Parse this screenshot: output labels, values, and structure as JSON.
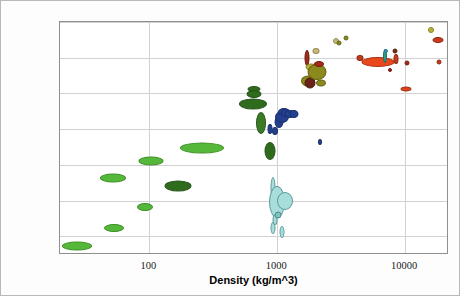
{
  "chart_data": {
    "type": "scatter",
    "title": "",
    "xlabel": "Density (kg/m^3)",
    "ylabel": "Young's modulus (GPa)",
    "xscale": "log",
    "yscale": "log",
    "xlim": [
      20,
      22000
    ],
    "ylim": [
      0.0003,
      1000
    ],
    "grid": true,
    "legend": "none",
    "xticks": [
      "100",
      "1000",
      "10000"
    ],
    "xtick_values": [
      100,
      1000,
      10000
    ],
    "yticks": [
      "1000",
      "100",
      "10",
      "1",
      "0.1",
      "0.01",
      "0.001"
    ],
    "ytick_values": [
      1000,
      100,
      10,
      1,
      0.1,
      0.01,
      0.001
    ],
    "marker_shape": "ellipse",
    "bubbles": [
      {
        "group": "foams-low-density",
        "x": 27,
        "y": 0.00055,
        "w": 30,
        "h": 9,
        "color": "#56b83a",
        "stroke": "#3f8f28"
      },
      {
        "group": "foams-low-density",
        "x": 53,
        "y": 0.0017,
        "w": 20,
        "h": 8,
        "color": "#56b83a",
        "stroke": "#3f8f28"
      },
      {
        "group": "foams-low-density",
        "x": 52,
        "y": 0.042,
        "w": 26,
        "h": 9,
        "color": "#56b83a",
        "stroke": "#3f8f28"
      },
      {
        "group": "foams-low-density",
        "x": 93,
        "y": 0.0065,
        "w": 16,
        "h": 8,
        "color": "#56b83a",
        "stroke": "#3f8f28"
      },
      {
        "group": "foams-low-density",
        "x": 103,
        "y": 0.125,
        "w": 25,
        "h": 9,
        "color": "#56b83a",
        "stroke": "#3f8f28"
      },
      {
        "group": "cork-natural",
        "x": 167,
        "y": 0.026,
        "w": 27,
        "h": 11,
        "color": "#2f6b1d",
        "stroke": "#24521a"
      },
      {
        "group": "foams-low-density",
        "x": 260,
        "y": 0.3,
        "w": 44,
        "h": 11,
        "color": "#56b83a",
        "stroke": "#3f8f28"
      },
      {
        "group": "wood-parallel",
        "x": 660,
        "y": 13.0,
        "w": 13,
        "h": 6,
        "color": "#2f6b1d",
        "stroke": "#24521a"
      },
      {
        "group": "wood-parallel",
        "x": 660,
        "y": 9.5,
        "w": 15,
        "h": 8,
        "color": "#2f6b1d",
        "stroke": "#24521a"
      },
      {
        "group": "wood-parallel",
        "x": 640,
        "y": 5.2,
        "w": 28,
        "h": 11,
        "color": "#2f6b1d",
        "stroke": "#24521a"
      },
      {
        "group": "wood-perpendicular",
        "x": 745,
        "y": 1.5,
        "w": 10,
        "h": 22,
        "color": "#3d7a28",
        "stroke": "#2d5c1e"
      },
      {
        "group": "wood-perpendicular",
        "x": 880,
        "y": 0.25,
        "w": 11,
        "h": 18,
        "color": "#2f6b1d",
        "stroke": "#24521a"
      },
      {
        "group": "wood-perpendicular",
        "x": 880,
        "y": 1.0,
        "w": 5,
        "h": 10,
        "color": "#23408f",
        "stroke": "#1b3070"
      },
      {
        "group": "polymers",
        "x": 960,
        "y": 0.9,
        "w": 6,
        "h": 8,
        "color": "#23408f",
        "stroke": "#1b3070"
      },
      {
        "group": "polymers",
        "x": 1030,
        "y": 1.6,
        "w": 9,
        "h": 12,
        "color": "#23408f",
        "stroke": "#1b3070"
      },
      {
        "group": "polymers",
        "x": 1080,
        "y": 2.2,
        "w": 14,
        "h": 12,
        "color": "#23408f",
        "stroke": "#1b3070"
      },
      {
        "group": "polymers",
        "x": 1130,
        "y": 3.0,
        "w": 12,
        "h": 8,
        "color": "#23408f",
        "stroke": "#1b3070"
      },
      {
        "group": "polymers",
        "x": 1180,
        "y": 2.9,
        "w": 10,
        "h": 8,
        "color": "#23408f",
        "stroke": "#1b3070"
      },
      {
        "group": "polymers",
        "x": 1260,
        "y": 2.7,
        "w": 11,
        "h": 8,
        "color": "#23408f",
        "stroke": "#1b3070"
      },
      {
        "group": "polymers",
        "x": 1340,
        "y": 2.6,
        "w": 9,
        "h": 8,
        "color": "#23408f",
        "stroke": "#1b3070"
      },
      {
        "group": "polymers",
        "x": 2150,
        "y": 0.44,
        "w": 4,
        "h": 6,
        "color": "#23408f",
        "stroke": "#1b3070"
      },
      {
        "group": "elastomers-foams",
        "x": 930,
        "y": 0.023,
        "w": 5,
        "h": 22,
        "color": "#a7ddda",
        "stroke": "#5e9c99"
      },
      {
        "group": "elastomers-foams",
        "x": 1000,
        "y": 0.009,
        "w": 16,
        "h": 32,
        "color": "#a7ddda",
        "stroke": "#5e9c99"
      },
      {
        "group": "elastomers-foams",
        "x": 1150,
        "y": 0.0095,
        "w": 16,
        "h": 18,
        "color": "#a7ddda",
        "stroke": "#5e9c99"
      },
      {
        "group": "elastomers-foams",
        "x": 930,
        "y": 0.0017,
        "w": 5,
        "h": 12,
        "color": "#a7ddda",
        "stroke": "#5e9c99"
      },
      {
        "group": "elastomers-foams",
        "x": 955,
        "y": 0.0028,
        "w": 5,
        "h": 10,
        "color": "#a7ddda",
        "stroke": "#5e9c99"
      },
      {
        "group": "elastomers-foams",
        "x": 1090,
        "y": 0.0013,
        "w": 5,
        "h": 12,
        "color": "#a7ddda",
        "stroke": "#5e9c99"
      },
      {
        "group": "elastomers-foams",
        "x": 1010,
        "y": 0.004,
        "w": 7,
        "h": 7,
        "color": "#7ec4c0",
        "stroke": "#4d8b88"
      },
      {
        "group": "ceramics",
        "x": 1700,
        "y": 100,
        "w": 5,
        "h": 16,
        "color": "#9c2a1a",
        "stroke": "#6e1c10"
      },
      {
        "group": "ceramics",
        "x": 1750,
        "y": 22,
        "w": 14,
        "h": 11,
        "color": "#8c8a1c",
        "stroke": "#646313"
      },
      {
        "group": "ceramics",
        "x": 1800,
        "y": 20,
        "w": 11,
        "h": 11,
        "color": "#6b2318",
        "stroke": "#4a180f"
      },
      {
        "group": "ceramics",
        "x": 1850,
        "y": 55,
        "w": 11,
        "h": 7,
        "color": "#b8b23a",
        "stroke": "#8a8527"
      },
      {
        "group": "ceramics",
        "x": 2000,
        "y": 150,
        "w": 7,
        "h": 6,
        "color": "#c9b878",
        "stroke": "#9a8c55"
      },
      {
        "group": "ceramics",
        "x": 2050,
        "y": 40,
        "w": 19,
        "h": 16,
        "color": "#8c8a1c",
        "stroke": "#646313"
      },
      {
        "group": "ceramics",
        "x": 2100,
        "y": 68,
        "w": 10,
        "h": 6,
        "color": "#a3291a",
        "stroke": "#761c10"
      },
      {
        "group": "ceramics",
        "x": 2200,
        "y": 20,
        "w": 10,
        "h": 7,
        "color": "#8c8a1c",
        "stroke": "#646313"
      },
      {
        "group": "ceramics",
        "x": 2900,
        "y": 300,
        "w": 6,
        "h": 6,
        "color": "#c2bb7e",
        "stroke": "#938c55"
      },
      {
        "group": "ceramics",
        "x": 3050,
        "y": 260,
        "w": 5,
        "h": 5,
        "color": "#8c8a1c",
        "stroke": "#646313"
      },
      {
        "group": "ceramics",
        "x": 3450,
        "y": 350,
        "w": 5,
        "h": 5,
        "color": "#8c8a1c",
        "stroke": "#646313"
      },
      {
        "group": "metals",
        "x": 4450,
        "y": 100,
        "w": 7,
        "h": 6,
        "color": "#c73b1c",
        "stroke": "#8e2812"
      },
      {
        "group": "metals",
        "x": 6100,
        "y": 78,
        "w": 33,
        "h": 10,
        "color": "#e8481c",
        "stroke": "#a83312"
      },
      {
        "group": "metals",
        "x": 7000,
        "y": 110,
        "w": 4,
        "h": 14,
        "color": "#2a9d8f",
        "stroke": "#1d6e64"
      },
      {
        "group": "metals",
        "x": 7050,
        "y": 150,
        "w": 4,
        "h": 4,
        "color": "#3aa0c0",
        "stroke": "#2a7490"
      },
      {
        "group": "metals",
        "x": 7600,
        "y": 45,
        "w": 4,
        "h": 4,
        "color": "#9c2a1a",
        "stroke": "#6e1c10"
      },
      {
        "group": "metals",
        "x": 8300,
        "y": 150,
        "w": 5,
        "h": 5,
        "color": "#7a2a16",
        "stroke": "#571d0f"
      },
      {
        "group": "metals",
        "x": 8400,
        "y": 95,
        "w": 5,
        "h": 10,
        "color": "#c73b1c",
        "stroke": "#8e2812"
      },
      {
        "group": "metals",
        "x": 10200,
        "y": 13,
        "w": 11,
        "h": 5,
        "color": "#d8431c",
        "stroke": "#9c3013"
      },
      {
        "group": "metals",
        "x": 10400,
        "y": 70,
        "w": 5,
        "h": 5,
        "color": "#a3291a",
        "stroke": "#761c10"
      },
      {
        "group": "metals",
        "x": 16000,
        "y": 580,
        "w": 6,
        "h": 6,
        "color": "#b8b23a",
        "stroke": "#8a8527"
      },
      {
        "group": "metals",
        "x": 18000,
        "y": 320,
        "w": 11,
        "h": 6,
        "color": "#c73b1c",
        "stroke": "#8e2812"
      },
      {
        "group": "metals",
        "x": 18500,
        "y": 78,
        "w": 5,
        "h": 5,
        "color": "#c73b1c",
        "stroke": "#8e2812"
      }
    ]
  },
  "colors": {
    "foam_green": "#56b83a",
    "wood_dark_green": "#2f6b1d",
    "polymer_blue": "#23408f",
    "elastomer_cyan": "#a7ddda",
    "ceramic_olive": "#8c8a1c",
    "metal_red": "#e8481c",
    "grid": "#d2d2d2",
    "frame": "#8f8f8f",
    "background": "#ffffff"
  }
}
